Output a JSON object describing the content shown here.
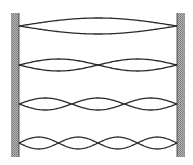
{
  "diagram": {
    "title": "",
    "walls": {
      "left": {
        "x": 11,
        "width": 8,
        "top": 13,
        "bottom": 157
      },
      "right": {
        "x": 177,
        "width": 8,
        "top": 13,
        "bottom": 157
      },
      "color": "#9a9a9a"
    },
    "string": {
      "x_start": 19,
      "x_end": 177,
      "stroke": "#2a2a2a",
      "stroke_width": 1.3
    },
    "modes": [
      {
        "harmonic": 1,
        "center_y": 26,
        "amplitude": 8,
        "loops": 1
      },
      {
        "harmonic": 2,
        "center_y": 65,
        "amplitude": 6,
        "loops": 2
      },
      {
        "harmonic": 3,
        "center_y": 104,
        "amplitude": 6,
        "loops": 3
      },
      {
        "harmonic": 4,
        "center_y": 143,
        "amplitude": 6,
        "loops": 4
      }
    ]
  }
}
